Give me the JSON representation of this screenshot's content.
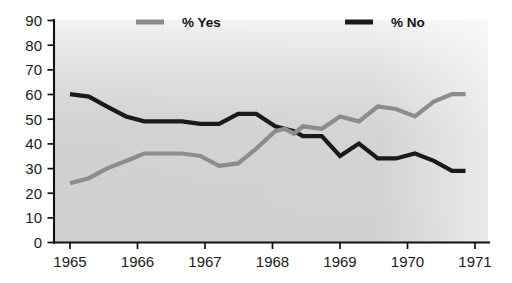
{
  "chart_data": {
    "type": "line",
    "title": "",
    "subtitle": "",
    "xlabel": "",
    "ylabel": "",
    "xlim": [
      1965,
      1971
    ],
    "ylim": [
      0,
      90
    ],
    "grid": false,
    "legend_position": "top",
    "y_ticks": [
      0,
      10,
      20,
      30,
      40,
      50,
      60,
      70,
      80,
      90
    ],
    "y_tick_labels": [
      "0",
      "10",
      "20",
      "30",
      "40",
      "50",
      "60",
      "70",
      "80",
      "90"
    ],
    "x_ticks": [
      1965,
      1966,
      1967,
      1968,
      1969,
      1970,
      1971
    ],
    "x_tick_labels": [
      "1965",
      "1966",
      "1967",
      "1968",
      "1969",
      "1970",
      "1971"
    ],
    "x": [
      1965.0,
      1965.28,
      1965.55,
      1965.83,
      1966.1,
      1966.38,
      1966.66,
      1966.93,
      1967.21,
      1967.49,
      1967.76,
      1968.04,
      1968.18,
      1968.32,
      1968.45,
      1968.73,
      1969.0,
      1969.28,
      1969.56,
      1969.83,
      1970.11,
      1970.39,
      1970.66,
      1970.86
    ],
    "series": [
      {
        "name": "% Yes",
        "color": "#8c8c8c",
        "values": [
          24,
          26,
          30,
          33,
          36,
          36,
          36,
          35,
          31,
          32,
          38,
          45,
          46,
          44,
          47,
          46,
          51,
          49,
          55,
          54,
          51,
          57,
          60,
          60
        ]
      },
      {
        "name": "% No",
        "color": "#1a1a1a",
        "values": [
          60,
          59,
          55,
          51,
          49,
          49,
          49,
          48,
          48,
          52,
          52,
          47,
          46,
          45,
          43,
          43,
          35,
          40,
          34,
          34,
          36,
          33,
          29,
          29
        ]
      }
    ],
    "legend": [
      {
        "label": "% Yes",
        "color": "#8c8c8c"
      },
      {
        "label": "% No",
        "color": "#1a1a1a"
      }
    ],
    "plot_background": "#d4d4d4",
    "axis_color": "#111111"
  }
}
